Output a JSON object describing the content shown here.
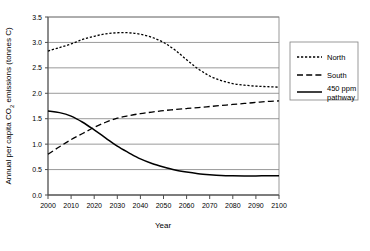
{
  "chart_data": {
    "type": "line",
    "title": "",
    "xlabel": "Year",
    "ylabel": "Annual per capita CO2 emissions (tonnes C)",
    "ylabel_parts": {
      "before": "Annual per capita CO",
      "subscript": "2",
      "after": " emissions (tonnes C)"
    },
    "xlim": [
      2000,
      2100
    ],
    "ylim": [
      0.0,
      3.5
    ],
    "grid": "horizontal",
    "legend_position": "right",
    "x": [
      2000,
      2010,
      2020,
      2030,
      2040,
      2050,
      2060,
      2070,
      2080,
      2090,
      2100
    ],
    "xticklabels": [
      "2000",
      "2010",
      "2020",
      "2030",
      "2040",
      "2050",
      "2060",
      "2070",
      "2080",
      "2090",
      "2100"
    ],
    "yticks": [
      0.0,
      0.5,
      1.0,
      1.5,
      2.0,
      2.5,
      3.0,
      3.5
    ],
    "yticklabels": [
      "0.0",
      "0.5",
      "1.0",
      "1.5",
      "2.0",
      "2.5",
      "3.0",
      "3.5"
    ],
    "series": [
      {
        "name": "North",
        "style": "dotted",
        "x": [
          2000,
          2005,
          2010,
          2015,
          2020,
          2025,
          2030,
          2035,
          2040,
          2045,
          2050,
          2055,
          2060,
          2065,
          2070,
          2075,
          2080,
          2085,
          2090,
          2095,
          2100
        ],
        "values": [
          2.83,
          2.9,
          2.97,
          3.06,
          3.12,
          3.17,
          3.19,
          3.19,
          3.16,
          3.1,
          3.0,
          2.85,
          2.66,
          2.48,
          2.34,
          2.25,
          2.19,
          2.16,
          2.14,
          2.13,
          2.12
        ]
      },
      {
        "name": "South",
        "style": "dashed",
        "x": [
          2000,
          2005,
          2010,
          2015,
          2020,
          2025,
          2030,
          2035,
          2040,
          2045,
          2050,
          2055,
          2060,
          2065,
          2070,
          2075,
          2080,
          2085,
          2090,
          2095,
          2100
        ],
        "values": [
          0.8,
          0.95,
          1.09,
          1.21,
          1.33,
          1.43,
          1.51,
          1.56,
          1.6,
          1.63,
          1.66,
          1.68,
          1.7,
          1.72,
          1.74,
          1.76,
          1.78,
          1.8,
          1.82,
          1.84,
          1.85
        ]
      },
      {
        "name": "450 ppm pathway",
        "style": "solid",
        "x": [
          2000,
          2005,
          2010,
          2015,
          2020,
          2025,
          2030,
          2035,
          2040,
          2045,
          2050,
          2055,
          2060,
          2065,
          2070,
          2075,
          2080,
          2085,
          2090,
          2095,
          2100
        ],
        "values": [
          1.65,
          1.62,
          1.55,
          1.43,
          1.28,
          1.12,
          0.96,
          0.83,
          0.71,
          0.62,
          0.55,
          0.49,
          0.45,
          0.42,
          0.4,
          0.385,
          0.378,
          0.375,
          0.376,
          0.378,
          0.38
        ]
      }
    ],
    "legend": [
      {
        "label": "North",
        "style": "dotted",
        "line1": "North",
        "line2": ""
      },
      {
        "label": "South",
        "style": "dashed",
        "line1": "South",
        "line2": ""
      },
      {
        "label": "450 ppm pathway",
        "style": "solid",
        "line1": "450 ppm",
        "line2": "pathway"
      }
    ],
    "colors": {
      "series": "#000000",
      "grid": "#808080",
      "axis": "#4d4d4d",
      "background": "#ffffff"
    }
  }
}
